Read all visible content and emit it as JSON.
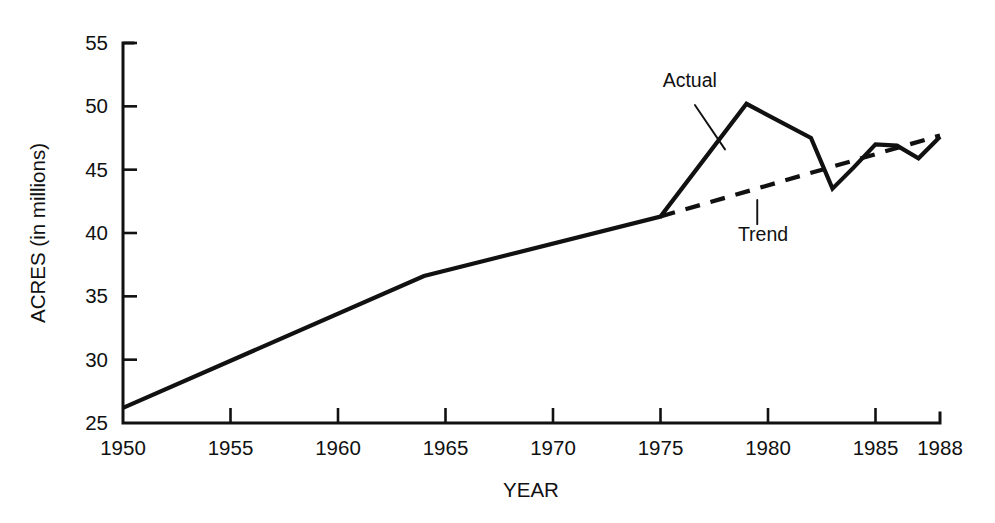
{
  "chart_data": {
    "type": "line",
    "title": "",
    "xlabel": "YEAR",
    "ylabel": "ACRES (in millions)",
    "xlim": [
      1950,
      1988
    ],
    "ylim": [
      25,
      55
    ],
    "grid": false,
    "legend_position": "inline-annotations",
    "x_ticks": [
      1950,
      1955,
      1960,
      1965,
      1970,
      1975,
      1980,
      1985,
      1988
    ],
    "x_tick_labels": [
      "1950",
      "1955",
      "1960",
      "1965",
      "1970",
      "1975",
      "1980",
      "1985",
      "1988"
    ],
    "y_ticks": [
      25,
      30,
      35,
      40,
      45,
      50,
      55
    ],
    "y_tick_labels": [
      "25",
      "30",
      "35",
      "40",
      "45",
      "50",
      "55"
    ],
    "series": [
      {
        "name": "Actual",
        "style": "solid",
        "color": "#111111",
        "x": [
          1950,
          1964,
          1975,
          1979,
          1982,
          1983,
          1984,
          1985,
          1986,
          1987,
          1988
        ],
        "values": [
          26.2,
          36.6,
          41.3,
          50.2,
          47.5,
          43.5,
          45.2,
          47.0,
          46.9,
          45.9,
          47.6
        ]
      },
      {
        "name": "Trend",
        "style": "dashed",
        "color": "#111111",
        "x": [
          1975,
          1988
        ],
        "values": [
          41.3,
          47.7
        ]
      }
    ],
    "annotations": [
      {
        "text": "Actual",
        "label_x": 1975.1,
        "label_y": 51.5,
        "leader_from_x": 1976.6,
        "leader_from_y": 50.1,
        "leader_to_x": 1978.0,
        "leader_to_y": 46.6
      },
      {
        "text": "Trend",
        "label_x": 1978.6,
        "label_y": 39.4,
        "leader_from_x": 1979.5,
        "leader_from_y": 42.6,
        "leader_to_x": 1979.5,
        "leader_to_y": 40.7
      }
    ]
  }
}
